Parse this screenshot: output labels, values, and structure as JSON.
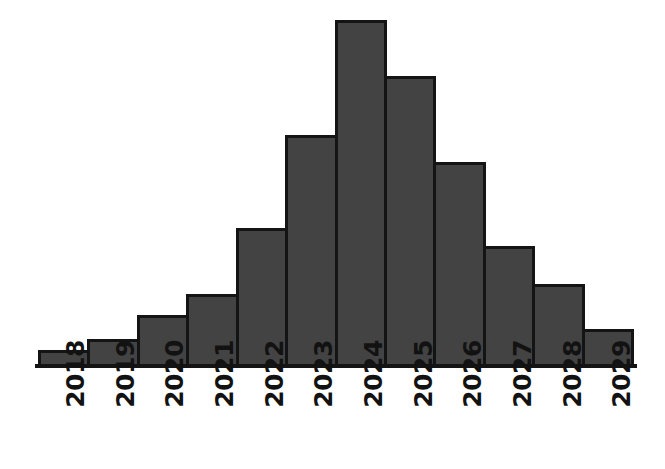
{
  "chart_data": {
    "type": "bar",
    "title": "",
    "subtitle": "",
    "xlabel": "",
    "ylabel": "",
    "categories": [
      "2018",
      "2019",
      "2020",
      "2021",
      "2022",
      "2023",
      "2024",
      "2025",
      "2026",
      "2027",
      "2028",
      "2029"
    ],
    "values": [
      5,
      8,
      15,
      21,
      40,
      67,
      100,
      84,
      59,
      35,
      24,
      11
    ],
    "ylim": [
      0,
      100
    ],
    "xlim_categories": 12,
    "grid": false,
    "legend": null,
    "legend_position": "none",
    "annotations": [],
    "axis_tick_labels": {
      "x": [
        "2018",
        "2019",
        "2020",
        "2021",
        "2022",
        "2023",
        "2024",
        "2025",
        "2026",
        "2027",
        "2028",
        "2029"
      ],
      "y": []
    },
    "style": {
      "bar_fill": "#434343",
      "bar_edge": "#141414",
      "bar_edge_width": 3,
      "axis_line_color": "#141414",
      "background": "#ffffff",
      "bars_contiguous": true,
      "x_tick_rotation_degrees": 90
    }
  },
  "bars": [
    {
      "label": "2018",
      "value": 5
    },
    {
      "label": "2019",
      "value": 8
    },
    {
      "label": "2020",
      "value": 15
    },
    {
      "label": "2021",
      "value": 21
    },
    {
      "label": "2022",
      "value": 40
    },
    {
      "label": "2023",
      "value": 67
    },
    {
      "label": "2024",
      "value": 100
    },
    {
      "label": "2025",
      "value": 84
    },
    {
      "label": "2026",
      "value": 59
    },
    {
      "label": "2027",
      "value": 35
    },
    {
      "label": "2028",
      "value": 24
    },
    {
      "label": "2029",
      "value": 11
    }
  ]
}
